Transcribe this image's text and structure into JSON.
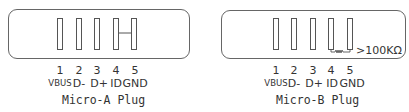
{
  "plugs": [
    {
      "title": "Micro-A Plug",
      "pin_numbers": [
        "1",
        "2",
        "3",
        "4",
        "5"
      ],
      "pin_signals": [
        "VBUS",
        "D-",
        "D+",
        "ID",
        "GND"
      ],
      "id_connection": "ID shorted to GND"
    },
    {
      "title": "Micro-B Plug",
      "pin_numbers": [
        "1",
        "2",
        "3",
        "4",
        "5"
      ],
      "pin_signals": [
        "VBUS",
        "D-",
        "D+",
        "ID",
        "GND"
      ],
      "id_connection": "ID to GND via resistor",
      "resistor_label": ">100KΩ"
    }
  ],
  "colors": {
    "outline": "#666666",
    "text": "#333333",
    "background": "#ffffff"
  }
}
